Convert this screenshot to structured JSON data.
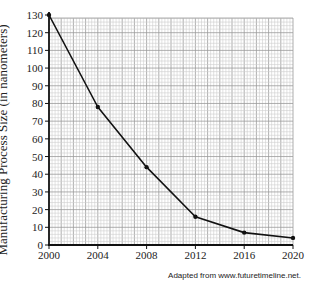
{
  "chart_data": {
    "type": "line",
    "title": "",
    "xlabel": "",
    "ylabel": "Manufacturing Process Size (in nanometers)",
    "x": [
      2000,
      2004,
      2008,
      2012,
      2016,
      2020
    ],
    "series": [
      {
        "name": "Process size",
        "values": [
          130,
          78,
          44,
          16,
          7,
          4
        ]
      }
    ],
    "xticks": [
      "2000",
      "2004",
      "2008",
      "2012",
      "2016",
      "2020"
    ],
    "yticks": [
      "0",
      "10",
      "20",
      "30",
      "40",
      "50",
      "60",
      "70",
      "80",
      "90",
      "100",
      "110",
      "120",
      "130"
    ],
    "xlim": [
      2000,
      2020
    ],
    "ylim": [
      0,
      130
    ],
    "grid": true,
    "legend": "none",
    "markers": true,
    "source_note": "Adapted from www.futuretimeline.net."
  },
  "labels": {
    "ylabel": "Manufacturing Process Size (in nanometers)",
    "source": "Adapted from www.futuretimeline.net."
  }
}
